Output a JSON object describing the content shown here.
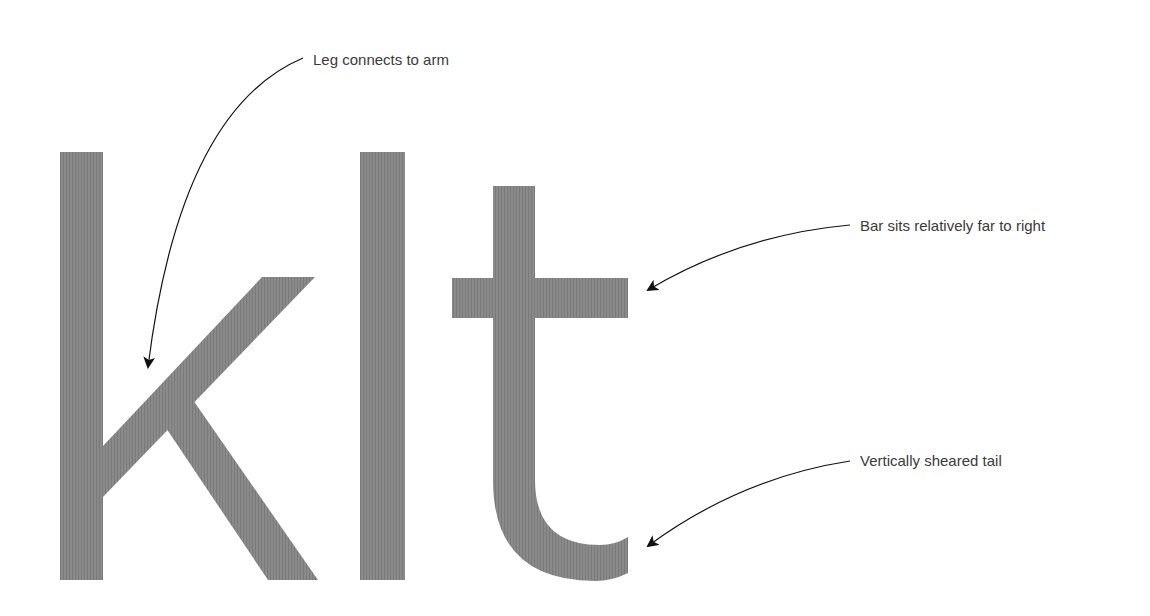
{
  "diagram": {
    "glyphs": [
      "k",
      "l",
      "t"
    ],
    "glyph_color": "#858585",
    "annotation_color": "#1a1a1a",
    "annotations": [
      {
        "id": "leg",
        "text": "Leg connects to arm",
        "target_glyph": "k"
      },
      {
        "id": "bar",
        "text": "Bar sits relatively far to right",
        "target_glyph": "t"
      },
      {
        "id": "tail",
        "text": "Vertically sheared tail",
        "target_glyph": "t"
      }
    ]
  }
}
